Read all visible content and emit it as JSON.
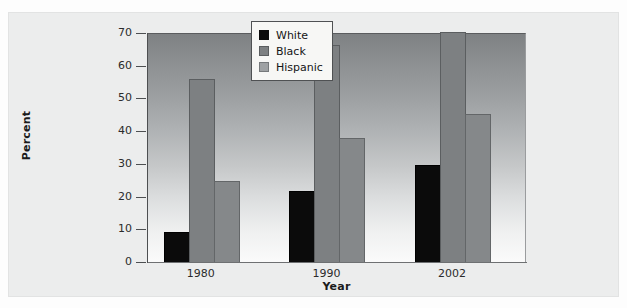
{
  "chart_data": {
    "type": "bar",
    "title": "",
    "xlabel": "Year",
    "ylabel": "Percent",
    "categories": [
      "1980",
      "1990",
      "2002"
    ],
    "series": [
      {
        "name": "White",
        "color": "#0b0b0b",
        "values": [
          9,
          21.5,
          29.5
        ]
      },
      {
        "name": "Black",
        "color": "#7d8082",
        "values": [
          55.5,
          66,
          70
        ]
      },
      {
        "name": "Hispanic",
        "color": "#85888a",
        "values": [
          24.5,
          37.5,
          45
        ]
      }
    ],
    "ylim": [
      0,
      70
    ],
    "yticks": [
      "0",
      "10",
      "20",
      "30",
      "40",
      "50",
      "60",
      "70"
    ],
    "ytick_values": [
      0,
      10,
      20,
      30,
      40,
      50,
      60,
      70
    ],
    "grid": false,
    "legend_position": "top-right",
    "plot_background": "vertical gradient dark-gray to white"
  },
  "axes": {
    "y_title": "Percent",
    "x_title": "Year",
    "y_ticks": [
      "70",
      "60",
      "50",
      "40",
      "30",
      "20",
      "10",
      "0"
    ],
    "x_ticks": [
      "1980",
      "1990",
      "2002"
    ]
  },
  "legend": {
    "entries": [
      {
        "label": "White"
      },
      {
        "label": "Black"
      },
      {
        "label": "Hispanic"
      }
    ]
  }
}
